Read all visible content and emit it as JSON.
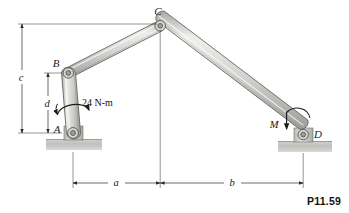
{
  "figure": {
    "number_label": "P11.59",
    "background_color": "#ffffff",
    "line_color": "#2b2b2b",
    "member_fill_light": "#e8e8e6",
    "member_fill_mid": "#c9c9c6",
    "member_fill_dark": "#a9a9a6",
    "ground_fill": "#c4c4c0"
  },
  "joints": [
    {
      "label": "A",
      "name": "joint-a",
      "x": 73,
      "y": 133,
      "type": "pin-support"
    },
    {
      "label": "B",
      "name": "joint-b",
      "x": 68,
      "y": 73,
      "type": "pin"
    },
    {
      "label": "C",
      "name": "joint-c",
      "x": 160,
      "y": 26,
      "type": "pin"
    },
    {
      "label": "D",
      "name": "joint-d",
      "x": 303,
      "y": 135,
      "type": "pin-support"
    }
  ],
  "members": [
    {
      "name": "link-ab",
      "from": "A",
      "to": "B"
    },
    {
      "name": "link-bc",
      "from": "B",
      "to": "C"
    },
    {
      "name": "link-cd",
      "from": "C",
      "to": "D"
    }
  ],
  "loads": [
    {
      "name": "applied-couple",
      "label": "24 N-m",
      "at": "link-AB",
      "sense": "curved-arrow"
    },
    {
      "name": "reaction-moment",
      "label": "M",
      "at": "joint-D",
      "sense": "curved-arrow"
    }
  ],
  "dimensions": [
    {
      "name": "dimension-c",
      "label": "c",
      "orientation": "vertical",
      "from": "ground-level",
      "to": "C-level"
    },
    {
      "name": "dimension-d",
      "label": "d",
      "orientation": "vertical",
      "from": "A-level",
      "to": "B-level"
    },
    {
      "name": "dimension-a",
      "label": "a",
      "orientation": "horizontal",
      "from": "A",
      "to": "C"
    },
    {
      "name": "dimension-b",
      "label": "b",
      "orientation": "horizontal",
      "from": "C",
      "to": "D"
    }
  ]
}
